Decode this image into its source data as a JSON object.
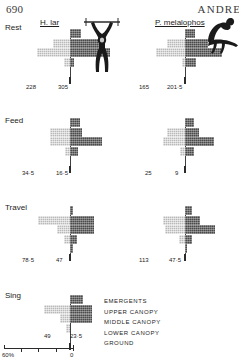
{
  "page": {
    "folio": "690",
    "running_head": "ANDRE"
  },
  "species": {
    "left": "H. lar",
    "right": "P. melalophos"
  },
  "legend": {
    "items": [
      "EMERGENTS",
      "UPPER  CANOPY",
      "MIDDLE  CANOPY",
      "LOWER  CANOPY",
      "GROUND"
    ]
  },
  "scale": {
    "left_label": "60%",
    "center_label": "0"
  },
  "colors": {
    "light": "#b9b9b9",
    "dark": "#4a4a4a",
    "axis": "#404040",
    "text": "#1d1d1d"
  },
  "chart_data": {
    "type": "bar",
    "subtitle": "Back-to-back (butterfly) percentage bars; left bars light-shaded, right bars dark-shaded",
    "xlabel": "Percentage of records (%)",
    "ylabel": "Canopy stratum",
    "xlim": [
      -60,
      60
    ],
    "grid": false,
    "legend_position": "right",
    "strata": [
      "EMERGENTS",
      "UPPER  CANOPY",
      "MIDDLE  CANOPY",
      "LOWER  CANOPY",
      "GROUND"
    ],
    "panels": [
      {
        "activity": "Rest",
        "species": "H. lar",
        "sample_left": "228",
        "sample_right": "305",
        "left_values": [
          0,
          21,
          41,
          8,
          0
        ],
        "right_values": [
          14,
          36,
          50,
          5,
          0
        ]
      },
      {
        "activity": "Rest",
        "species": "P. melalophos",
        "sample_left": "165",
        "sample_right": "201·5",
        "left_values": [
          0,
          22,
          36,
          4,
          0
        ],
        "right_values": [
          12,
          29,
          46,
          14,
          0
        ]
      },
      {
        "activity": "Feed",
        "species": "H. lar",
        "sample_left": "34·5",
        "sample_right": "16·5",
        "left_values": [
          0,
          25,
          25,
          6,
          0
        ],
        "right_values": [
          13,
          15,
          40,
          10,
          0
        ]
      },
      {
        "activity": "Feed",
        "species": "P. melalophos",
        "sample_left": "25",
        "sample_right": "9",
        "left_values": [
          0,
          22,
          28,
          6,
          0
        ],
        "right_values": [
          11,
          17,
          36,
          11,
          0
        ]
      },
      {
        "activity": "Travel",
        "species": "H. lar",
        "sample_left": "78·5",
        "sample_right": "47",
        "left_values": [
          0,
          40,
          16,
          8,
          0
        ],
        "right_values": [
          4,
          30,
          30,
          9,
          4
        ]
      },
      {
        "activity": "Travel",
        "species": "P. melalophos",
        "sample_left": "113",
        "sample_right": "47·5",
        "left_values": [
          0,
          27,
          25,
          7,
          0
        ],
        "right_values": [
          9,
          19,
          38,
          9,
          3
        ]
      },
      {
        "activity": "Sing",
        "species": "H. lar",
        "sample_left": "49",
        "sample_right": "23·5",
        "left_values": [
          0,
          32,
          13,
          5,
          0
        ],
        "right_values": [
          16,
          28,
          28,
          0,
          0
        ]
      }
    ]
  }
}
